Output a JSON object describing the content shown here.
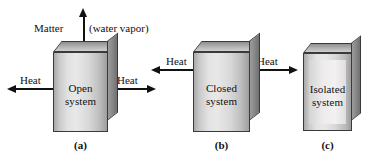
{
  "panels": [
    {
      "id": "open",
      "caption": "(a)",
      "box_label_line1": "Open",
      "box_label_line2": "system",
      "flows": [
        {
          "name": "matter-out",
          "label_left": "Matter",
          "label_right": "(water vapor)",
          "direction": "up"
        },
        {
          "name": "heat-left",
          "label": "Heat",
          "direction": "left"
        },
        {
          "name": "heat-right",
          "label": "Heat",
          "direction": "right"
        }
      ]
    },
    {
      "id": "closed",
      "caption": "(b)",
      "box_label_line1": "Closed",
      "box_label_line2": "system",
      "flows": [
        {
          "name": "heat-left",
          "label": "Heat",
          "direction": "left"
        },
        {
          "name": "heat-right",
          "label": "Heat",
          "direction": "right"
        }
      ]
    },
    {
      "id": "isolated",
      "caption": "(c)",
      "box_label_line1": "Isolated",
      "box_label_line2": "system",
      "flows": []
    }
  ],
  "colors": {
    "ink": "#111111",
    "box_outline": "#3a3a3a",
    "box_front_light": "#e8e8e8",
    "box_front_dark": "#9e9e9e",
    "box_top": "#b4b4b4",
    "box_side": "#8a8a8a",
    "insulation": "#f2f1f1",
    "background": "#ffffff"
  }
}
